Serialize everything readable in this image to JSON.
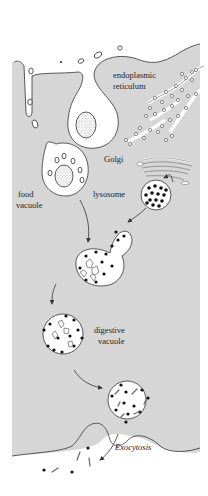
{
  "diagram": {
    "title": "",
    "colors": {
      "cytoplasm": "#d6d6d6",
      "background": "#ffffff",
      "outline": "#333333",
      "enzyme_dots": "#111111"
    },
    "labels": {
      "er": [
        "endoplasmic",
        "reticulum"
      ],
      "golgi": "Golgi",
      "lysosome": "lysosome",
      "food_vacuole": [
        "food",
        "vacuole"
      ],
      "digestive_vacuole": [
        "digestive",
        "vacuole"
      ],
      "exocytosis": "Exocytosis"
    },
    "stages": [
      "phagocytosis",
      "food vacuole",
      "lysosome fusion",
      "digestive vacuole",
      "late digestive vacuole",
      "exocytosis"
    ]
  }
}
